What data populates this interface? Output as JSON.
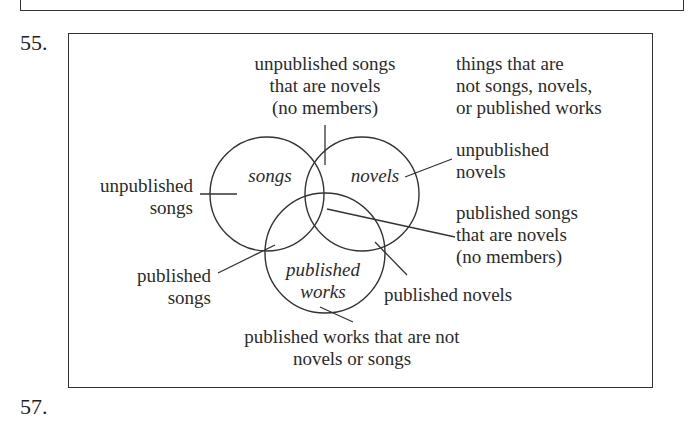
{
  "questions": {
    "q55_number": "55.",
    "q57_number": "57."
  },
  "diagram": {
    "type": "venn",
    "sets": [
      {
        "name": "songs",
        "label": "songs"
      },
      {
        "name": "novels",
        "label": "novels"
      },
      {
        "name": "published-works",
        "label_line1": "published",
        "label_line2": "works"
      }
    ],
    "annotations": {
      "top_center": {
        "line1": "unpublished songs",
        "line2": "that are novels",
        "line3": "(no members)"
      },
      "top_right": {
        "line1": "things that are",
        "line2": "not songs, novels,",
        "line3": "or published works"
      },
      "right_upper": {
        "line1": "unpublished",
        "line2": "novels"
      },
      "right_middle": {
        "line1": "published songs",
        "line2": "that are novels",
        "line3": "(no members)"
      },
      "left_upper": {
        "line1": "unpublished",
        "line2": "songs"
      },
      "left_lower": {
        "line1": "published",
        "line2": "songs"
      },
      "bottom_right": {
        "line1": "published novels"
      },
      "bottom_center": {
        "line1": "published works that are not",
        "line2": "novels or songs"
      }
    },
    "stroke_color": "#333333"
  }
}
